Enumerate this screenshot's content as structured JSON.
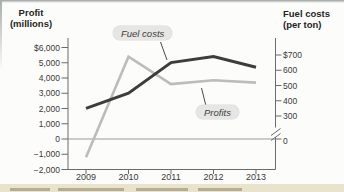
{
  "left_axis": {
    "title1": "Profit",
    "title2": "(millions)",
    "tick_labels": [
      "$6,000",
      "5,000",
      "4,000",
      "3,000",
      "2,000",
      "1,000",
      "0",
      "−1,000",
      "−2,000"
    ],
    "tick_values": [
      6000,
      5000,
      4000,
      3000,
      2000,
      1000,
      0,
      -1000,
      -2000
    ]
  },
  "right_axis": {
    "title1": "Fuel costs",
    "title2": "(per ton)",
    "tick_labels": [
      "$700",
      "600",
      "500",
      "400",
      "300"
    ],
    "tick_values": [
      700,
      600,
      500,
      400,
      300
    ],
    "zero_label": "0",
    "has_break": true
  },
  "x_axis": {
    "years": [
      "2009",
      "2010",
      "2011",
      "2012",
      "2013"
    ]
  },
  "chart_data": {
    "type": "line",
    "x": [
      "2009",
      "2010",
      "2011",
      "2012",
      "2013"
    ],
    "series": [
      {
        "name": "Fuel costs",
        "axis": "right",
        "color": "#3d3d3d",
        "values": [
          350,
          450,
          650,
          690,
          620
        ]
      },
      {
        "name": "Profits",
        "axis": "left",
        "color": "#bcbcbc",
        "values": [
          -1200,
          5400,
          3600,
          3850,
          3700
        ]
      }
    ],
    "left_ylabel": "Profit (millions)",
    "right_ylabel": "Fuel costs (per ton)",
    "left_ylim": [
      -2000,
      6000
    ],
    "right_ylim": [
      0,
      700
    ],
    "right_axis_break_between": [
      0,
      300
    ],
    "legend": "inline labels with callout lines",
    "grid": "zero line only"
  },
  "colors": {
    "fuel_line": "#3d3d3d",
    "profit_line": "#bcbcbc",
    "axis": "#6b6b6b",
    "zero_line": "#9a9a9a",
    "chip_bg": "#e6e6e4",
    "page_strip": "#e9e2cc"
  }
}
